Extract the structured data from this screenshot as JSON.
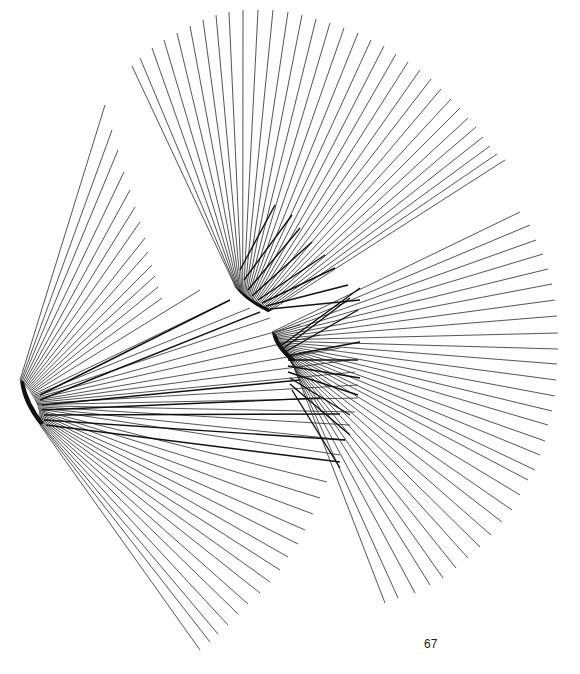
{
  "page": {
    "page_number": "67",
    "background": "#fefefe",
    "line_color": "#2a2a2a"
  },
  "artwork": {
    "description": "Three radiating fans of straight lines, each emerging from a dense curved pivot region",
    "fans": [
      {
        "name": "top-fan",
        "pivot_curve": {
          "x0": 236,
          "y0": 288,
          "x1": 268,
          "y1": 312
        },
        "count": 40,
        "start_angle_deg": -118,
        "end_angle_deg": -34,
        "endpoints_arc": [
          [
            132,
            66
          ],
          [
            140,
            58
          ],
          [
            152,
            48
          ],
          [
            164,
            40
          ],
          [
            177,
            33
          ],
          [
            190,
            26
          ],
          [
            203,
            20
          ],
          [
            216,
            15
          ],
          [
            229,
            12
          ],
          [
            243,
            10
          ],
          [
            258,
            10
          ],
          [
            273,
            10
          ],
          [
            288,
            12
          ],
          [
            302,
            15
          ],
          [
            316,
            19
          ],
          [
            330,
            23
          ],
          [
            344,
            28
          ],
          [
            358,
            33
          ],
          [
            371,
            40
          ],
          [
            384,
            46
          ],
          [
            396,
            54
          ],
          [
            408,
            62
          ],
          [
            420,
            70
          ],
          [
            431,
            79
          ],
          [
            441,
            89
          ],
          [
            451,
            99
          ],
          [
            460,
            108
          ],
          [
            468,
            118
          ],
          [
            476,
            127
          ],
          [
            483,
            137
          ],
          [
            490,
            146
          ],
          [
            497,
            154
          ],
          [
            505,
            160
          ]
        ],
        "inner_ticks": [
          [
            [
              240,
              270
            ],
            [
              275,
              205
            ]
          ],
          [
            [
              244,
              280
            ],
            [
              292,
              215
            ]
          ],
          [
            [
              248,
              290
            ],
            [
              300,
              228
            ]
          ],
          [
            [
              252,
              296
            ],
            [
              312,
              242
            ]
          ],
          [
            [
              258,
              300
            ],
            [
              325,
              255
            ]
          ],
          [
            [
              262,
              303
            ],
            [
              335,
              268
            ]
          ],
          [
            [
              266,
              306
            ],
            [
              348,
              285
            ]
          ],
          [
            [
              270,
              309
            ],
            [
              360,
              300
            ]
          ]
        ]
      },
      {
        "name": "left-fan",
        "pivot_curve": {
          "x0": 20,
          "y0": 380,
          "x1": 40,
          "y1": 425
        },
        "count": 46,
        "endpoints_arc": [
          [
            105,
            105
          ],
          [
            112,
            130
          ],
          [
            118,
            150
          ],
          [
            124,
            172
          ],
          [
            130,
            190
          ],
          [
            135,
            207
          ],
          [
            140,
            222
          ],
          [
            145,
            238
          ],
          [
            148,
            252
          ],
          [
            152,
            265
          ],
          [
            155,
            276
          ],
          [
            158,
            287
          ],
          [
            162,
            298
          ],
          [
            200,
            290
          ],
          [
            230,
            300
          ],
          [
            250,
            308
          ],
          [
            270,
            318
          ],
          [
            300,
            325
          ],
          [
            320,
            335
          ],
          [
            340,
            348
          ],
          [
            350,
            360
          ],
          [
            355,
            372
          ],
          [
            358,
            385
          ],
          [
            358,
            398
          ],
          [
            355,
            412
          ],
          [
            350,
            425
          ],
          [
            345,
            440
          ],
          [
            340,
            455
          ],
          [
            327,
            482
          ],
          [
            320,
            498
          ],
          [
            313,
            514
          ],
          [
            305,
            530
          ],
          [
            298,
            544
          ],
          [
            288,
            557
          ],
          [
            280,
            570
          ],
          [
            270,
            582
          ],
          [
            260,
            593
          ],
          [
            248,
            604
          ],
          [
            238,
            614
          ],
          [
            228,
            625
          ],
          [
            218,
            634
          ],
          [
            210,
            642
          ],
          [
            200,
            650
          ]
        ],
        "inner_ticks": [
          [
            [
              40,
              395
            ],
            [
              230,
              300
            ]
          ],
          [
            [
              40,
              400
            ],
            [
              260,
              312
            ]
          ],
          [
            [
              42,
              405
            ],
            [
              300,
              380
            ]
          ],
          [
            [
              42,
              410
            ],
            [
              320,
              398
            ]
          ],
          [
            [
              44,
              415
            ],
            [
              340,
              414
            ]
          ],
          [
            [
              44,
              420
            ],
            [
              345,
              440
            ]
          ],
          [
            [
              46,
              425
            ],
            [
              340,
              462
            ]
          ]
        ]
      },
      {
        "name": "right-fan",
        "pivot_curve": {
          "x0": 272,
          "y0": 332,
          "x1": 292,
          "y1": 362
        },
        "count": 42,
        "endpoints_arc": [
          [
            520,
            212
          ],
          [
            530,
            225
          ],
          [
            536,
            240
          ],
          [
            543,
            254
          ],
          [
            548,
            269
          ],
          [
            552,
            284
          ],
          [
            555,
            300
          ],
          [
            557,
            316
          ],
          [
            558,
            333
          ],
          [
            558,
            349
          ],
          [
            557,
            364
          ],
          [
            556,
            380
          ],
          [
            555,
            396
          ],
          [
            552,
            411
          ],
          [
            548,
            425
          ],
          [
            545,
            441
          ],
          [
            540,
            455
          ],
          [
            535,
            470
          ],
          [
            528,
            480
          ],
          [
            520,
            495
          ],
          [
            512,
            510
          ],
          [
            502,
            522
          ],
          [
            491,
            535
          ],
          [
            480,
            547
          ],
          [
            468,
            558
          ],
          [
            456,
            568
          ],
          [
            443,
            578
          ],
          [
            430,
            585
          ],
          [
            415,
            593
          ],
          [
            398,
            598
          ],
          [
            385,
            603
          ]
        ],
        "inner_ticks": [
          [
            [
              282,
              345
            ],
            [
              360,
              288
            ]
          ],
          [
            [
              284,
              348
            ],
            [
              350,
              298
            ]
          ],
          [
            [
              285,
              352
            ],
            [
              358,
              310
            ]
          ],
          [
            [
              286,
              356
            ],
            [
              360,
              342
            ]
          ],
          [
            [
              288,
              360
            ],
            [
              358,
              360
            ]
          ],
          [
            [
              288,
              366
            ],
            [
              360,
              378
            ]
          ],
          [
            [
              288,
              372
            ],
            [
              358,
              395
            ]
          ],
          [
            [
              290,
              378
            ],
            [
              350,
              415
            ]
          ],
          [
            [
              290,
              384
            ],
            [
              350,
              435
            ]
          ],
          [
            [
              292,
              390
            ],
            [
              340,
              468
            ]
          ]
        ]
      }
    ]
  }
}
